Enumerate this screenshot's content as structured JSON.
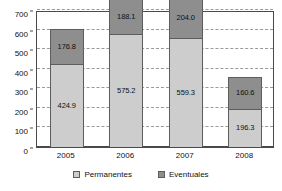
{
  "chart_data": {
    "type": "bar",
    "subtype": "stacked-bar",
    "title": "",
    "xlabel": "",
    "ylabel": "",
    "categories": [
      "2005",
      "2006",
      "2007",
      "2008"
    ],
    "series": [
      {
        "name": "Permanentes",
        "color": "#cdcdcd",
        "values": [
          424.9,
          575.2,
          559.3,
          196.3
        ],
        "labels": [
          "424.9",
          "575.2",
          "559.3",
          "196.3"
        ]
      },
      {
        "name": "Eventuales",
        "color": "#8e8e8e",
        "values": [
          176.8,
          188.1,
          204.0,
          160.6
        ],
        "labels": [
          "176.8",
          "188.1",
          "204.0",
          "160.6"
        ]
      }
    ],
    "totals": [
      601.7,
      763.3,
      763.3,
      356.9
    ],
    "ylim": [
      0,
      700
    ],
    "ytick_step": 100,
    "yticks": [
      0,
      100,
      200,
      300,
      400,
      500,
      600,
      700
    ],
    "ytick_labels": [
      "0",
      "100",
      "200",
      "300",
      "400",
      "500",
      "600",
      "700"
    ],
    "grid": true,
    "grid_style": "dashed",
    "legend_position": "bottom-center"
  },
  "legend": {
    "items": [
      {
        "label": "Permanentes",
        "swatch": "legend-swatch-permanentes"
      },
      {
        "label": "Eventuales",
        "swatch": "legend-swatch-eventuales"
      }
    ]
  },
  "colors": {
    "permanentes": "#cdcdcd",
    "eventuales": "#8e8e8e",
    "axis": "#4a4a4a",
    "grid": "#9a9a9a",
    "text": "#111111",
    "background": "#ffffff"
  }
}
